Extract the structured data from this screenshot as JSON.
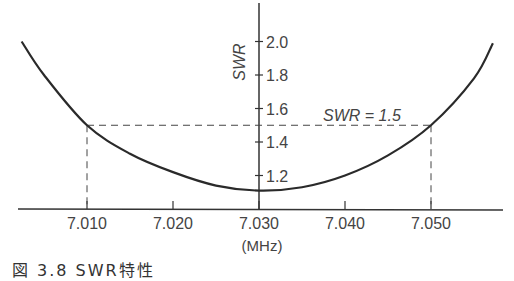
{
  "chart_data": {
    "type": "line",
    "title": "",
    "xlabel": "(MHz)",
    "ylabel": "SWR",
    "x_ticks": [
      7.01,
      7.02,
      7.03,
      7.04,
      7.05
    ],
    "x_tick_labels": [
      "7.010",
      "7.020",
      "7.030",
      "7.040",
      "7.050"
    ],
    "y_ticks": [
      1.2,
      1.4,
      1.6,
      1.8,
      2.0
    ],
    "y_tick_labels": [
      "1.2",
      "1.4",
      "1.6",
      "1.8",
      "2.0"
    ],
    "xlim": [
      7.0,
      7.058
    ],
    "ylim": [
      1.0,
      2.2
    ],
    "grid": false,
    "legend": null,
    "series": [
      {
        "name": "SWR curve",
        "x": [
          7.0024,
          7.005,
          7.01,
          7.015,
          7.02,
          7.025,
          7.03,
          7.035,
          7.04,
          7.045,
          7.05,
          7.055,
          7.0572
        ],
        "y": [
          2.0,
          1.8,
          1.5,
          1.33,
          1.22,
          1.14,
          1.11,
          1.13,
          1.2,
          1.32,
          1.5,
          1.78,
          1.99
        ]
      }
    ],
    "reference_line": {
      "y": 1.5,
      "style": "dashed",
      "label": "SWR = 1.5"
    },
    "reference_verticals": [
      7.01,
      7.05
    ],
    "annotations": [
      {
        "text": "SWR = 1.5",
        "x": 7.044,
        "y": 1.54
      }
    ]
  },
  "labels": {
    "ylabel": "SWR",
    "xunit": "(MHz)",
    "swr_annotation": "SWR = 1.5",
    "caption": "図 3.8  SWR特性"
  }
}
